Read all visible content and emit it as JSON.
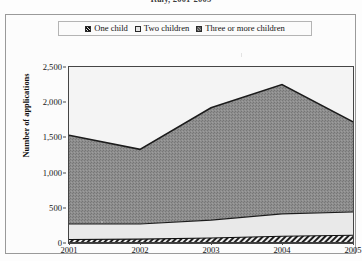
{
  "chart_data": {
    "type": "area",
    "stacked": true,
    "title": "Italy, 2001-2005",
    "xlabel": "",
    "ylabel": "Number of applications",
    "categories": [
      "2001",
      "2002",
      "2003",
      "2004",
      "2005"
    ],
    "x_tick_labels": [
      "2001",
      "2002",
      "2003",
      "2004",
      "2005"
    ],
    "y_tick_labels": [
      "0",
      "500",
      "1,000",
      "1,500",
      "2,000",
      "2,500"
    ],
    "y_tick_values": [
      0,
      500,
      1000,
      1500,
      2000,
      2500
    ],
    "ylim": [
      0,
      2500
    ],
    "grid": false,
    "legend_position": "top",
    "series": [
      {
        "name": "One child",
        "values": [
          50,
          55,
          70,
          95,
          110
        ],
        "fill": "#3c3c3c",
        "pattern": "diagonal-hatch"
      },
      {
        "name": "Two children",
        "values": [
          220,
          215,
          255,
          320,
          330
        ],
        "fill": "#e8e8e8",
        "pattern": "solid"
      },
      {
        "name": "Three or more children",
        "values": [
          1260,
          1060,
          1595,
          1835,
          1280
        ],
        "fill": "#8c8c8c",
        "pattern": "speckle"
      }
    ],
    "stack_totals": [
      1530,
      1330,
      1920,
      2250,
      1720
    ],
    "cumulative": {
      "one_child": [
        50,
        55,
        70,
        95,
        110
      ],
      "one_plus_two": [
        270,
        270,
        325,
        415,
        440
      ],
      "total": [
        1530,
        1330,
        1920,
        2250,
        1720
      ]
    }
  },
  "legend": {
    "items": [
      {
        "label": "One child",
        "marker": "hatched-square-icon"
      },
      {
        "label": "Two children",
        "marker": "light-square-icon"
      },
      {
        "label": "Three or more children",
        "marker": "gray-square-icon"
      }
    ]
  },
  "colors": {
    "one_child": "#3c3c3c",
    "two_children": "#e8e8e8",
    "three_or_more": "#8c8c8c",
    "axis": "#454545",
    "frame": "#9a9a9a",
    "plot_background": "#f2f2f2",
    "text": "#151515"
  }
}
